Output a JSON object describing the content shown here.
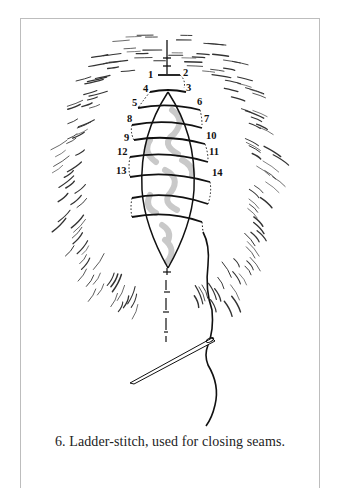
{
  "figure": {
    "caption": "6. Ladder-stitch, used for closing seams.",
    "stitch_numbers": [
      "1",
      "2",
      "3",
      "4",
      "5",
      "6",
      "7",
      "8",
      "9",
      "10",
      "11",
      "12",
      "13",
      "14"
    ],
    "colors": {
      "ink": "#111111",
      "fur": "#333333",
      "shading": "#c8c8c8",
      "frame": "#bdbdbd"
    },
    "elements": [
      "fur-pelt",
      "seam-opening",
      "ladder-stitches",
      "needle",
      "thread"
    ]
  }
}
